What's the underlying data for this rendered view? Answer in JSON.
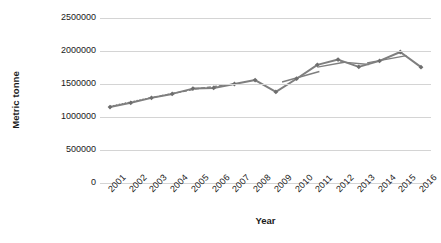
{
  "chart_data": {
    "type": "line",
    "title": "",
    "xlabel": "Year",
    "ylabel": "Metric tonne",
    "grid": true,
    "legend": "none",
    "xlim": [
      2001,
      2016
    ],
    "ylim": [
      0,
      2500000
    ],
    "ytick_labels": [
      "2500000",
      "2000000",
      "1500000",
      "1000000",
      "500000",
      "0"
    ],
    "ytick_values": [
      2500000,
      2000000,
      1500000,
      1000000,
      500000,
      0
    ],
    "xtick_labels": [
      "2001",
      "2002",
      "2003",
      "2004",
      "2005",
      "2006",
      "2007",
      "2008",
      "2009",
      "2010",
      "2011",
      "2012",
      "2013",
      "2014",
      "2015",
      "2016"
    ],
    "categories": [
      2001,
      2002,
      2003,
      2004,
      2005,
      2006,
      2007,
      2008,
      2009,
      2010,
      2011,
      2012,
      2013,
      2014,
      2015,
      2016
    ],
    "series": [
      {
        "name": "Production",
        "color": "#7f7f7f",
        "marker": "diamond",
        "values": [
          1150000,
          1215000,
          1290000,
          1350000,
          1430000,
          1440000,
          1500000,
          1560000,
          1380000,
          1580000,
          1790000,
          1870000,
          1760000,
          1850000,
          1985000,
          1755000
        ]
      }
    ],
    "trend_segments": [
      {
        "name": "trend-2001-2003",
        "x0": 2001.0,
        "y0": 1160000,
        "x1": 2003.0,
        "y1": 1295000,
        "style": "dotted"
      },
      {
        "name": "trend-2003-2005",
        "x0": 2003.1,
        "y0": 1300000,
        "x1": 2005.0,
        "y1": 1415000,
        "style": "dashed"
      },
      {
        "name": "trend-2005-2007",
        "x0": 2005.1,
        "y0": 1425000,
        "x1": 2007.0,
        "y1": 1500000,
        "style": "dashed"
      },
      {
        "name": "trend-2009-2011",
        "x0": 2009.3,
        "y0": 1530000,
        "x1": 2011.1,
        "y1": 1690000,
        "style": "solid"
      },
      {
        "name": "trend-2011-2012",
        "x0": 2011.0,
        "y0": 1755000,
        "x1": 2012.3,
        "y1": 1830000,
        "style": "solid"
      },
      {
        "name": "trend-2012-2013",
        "x0": 2012.1,
        "y0": 1835000,
        "x1": 2013.5,
        "y1": 1795000,
        "style": "solid"
      },
      {
        "name": "trend-2013-2015",
        "x0": 2013.4,
        "y0": 1820000,
        "x1": 2015.3,
        "y1": 1930000,
        "style": "solid"
      }
    ],
    "colors": {
      "line": "#7f7f7f",
      "marker": "#6e6e6e",
      "grid": "#d4d4d4",
      "text": "#1a1a1a",
      "background": "#ffffff"
    }
  }
}
